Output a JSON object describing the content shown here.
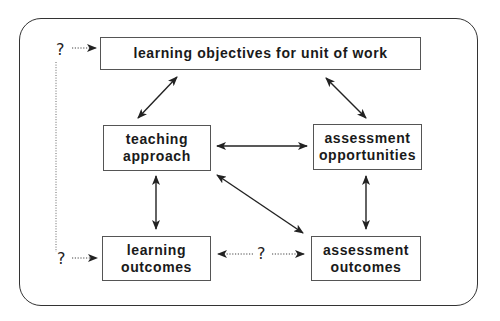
{
  "diagram": {
    "nodes": {
      "objectives": {
        "line1": "learning objectives for unit of work"
      },
      "teaching": {
        "line1": "teaching",
        "line2": "approach"
      },
      "assess_opp": {
        "line1": "assessment",
        "line2": "opportunities"
      },
      "learn_out": {
        "line1": "learning",
        "line2": "outcomes"
      },
      "assess_out": {
        "line1": "assessment",
        "line2": "outcomes"
      }
    },
    "unknown_marks": {
      "top_left": "?",
      "bottom_left": "?",
      "middle": "?"
    },
    "connections": [
      {
        "from": "objectives",
        "to": "teaching",
        "style": "solid",
        "direction": "both"
      },
      {
        "from": "objectives",
        "to": "assess_opp",
        "style": "solid",
        "direction": "both"
      },
      {
        "from": "teaching",
        "to": "assess_opp",
        "style": "solid",
        "direction": "both"
      },
      {
        "from": "teaching",
        "to": "learn_out",
        "style": "solid",
        "direction": "both"
      },
      {
        "from": "teaching",
        "to": "assess_out",
        "style": "solid",
        "direction": "both"
      },
      {
        "from": "assess_opp",
        "to": "assess_out",
        "style": "solid",
        "direction": "both"
      },
      {
        "from": "learn_out",
        "to": "assess_out",
        "style": "dotted",
        "direction": "both",
        "label": "?"
      },
      {
        "from": "?",
        "to": "objectives",
        "style": "dotted",
        "direction": "one-way"
      },
      {
        "from": "?",
        "to": "learn_out",
        "style": "dotted",
        "direction": "one-way"
      }
    ],
    "colors": {
      "line": "#222222",
      "box_border": "#555555",
      "text": "#1a1a1a"
    }
  }
}
